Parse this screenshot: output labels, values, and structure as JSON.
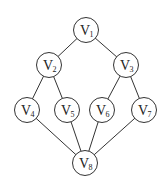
{
  "diagram": {
    "type": "graph",
    "nodes": [
      {
        "id": "V1",
        "label": "V",
        "sub": "1",
        "x": 86,
        "y": 30
      },
      {
        "id": "V2",
        "label": "V",
        "sub": "2",
        "x": 49,
        "y": 65
      },
      {
        "id": "V3",
        "label": "V",
        "sub": "3",
        "x": 126,
        "y": 65
      },
      {
        "id": "V4",
        "label": "V",
        "sub": "4",
        "x": 27,
        "y": 110
      },
      {
        "id": "V5",
        "label": "V",
        "sub": "5",
        "x": 67,
        "y": 110
      },
      {
        "id": "V6",
        "label": "V",
        "sub": "6",
        "x": 102,
        "y": 110
      },
      {
        "id": "V7",
        "label": "V",
        "sub": "7",
        "x": 144,
        "y": 110
      },
      {
        "id": "V8",
        "label": "V",
        "sub": "8",
        "x": 85,
        "y": 163
      }
    ],
    "edges": [
      [
        "V1",
        "V2"
      ],
      [
        "V1",
        "V3"
      ],
      [
        "V2",
        "V4"
      ],
      [
        "V2",
        "V5"
      ],
      [
        "V3",
        "V6"
      ],
      [
        "V3",
        "V7"
      ],
      [
        "V4",
        "V8"
      ],
      [
        "V5",
        "V8"
      ],
      [
        "V6",
        "V8"
      ],
      [
        "V7",
        "V8"
      ]
    ],
    "radius": 12.5
  }
}
